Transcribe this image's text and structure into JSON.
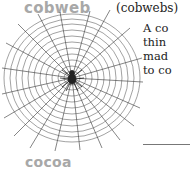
{
  "entry": {
    "headword": "cobweb",
    "plural": "(cobwebs)",
    "definition_lines": [
      "A co",
      "thin",
      "mad",
      "to co"
    ]
  },
  "illustration": {
    "subject": "spider-web-with-spider"
  },
  "next_entry": {
    "headword": "cocoa"
  },
  "colors": {
    "headword": "#a8a8a8",
    "text": "#222222",
    "web_lines": "#333333"
  }
}
